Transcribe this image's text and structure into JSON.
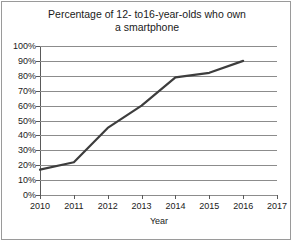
{
  "chart_data": {
    "type": "line",
    "title": "Percentage of 12- to16-year-olds who own a smartphone",
    "title_line1": "Percentage of 12- to16-year-olds who own",
    "title_line2": "a smartphone",
    "xlabel": "Year",
    "ylabel": "",
    "x": [
      2010,
      2011,
      2012,
      2013,
      2014,
      2015,
      2016
    ],
    "values": [
      17,
      22,
      45,
      60,
      79,
      82,
      90
    ],
    "series": [
      {
        "name": "Smartphone ownership",
        "values": [
          17,
          22,
          45,
          60,
          79,
          82,
          90
        ]
      }
    ],
    "xlim": [
      2010,
      2017
    ],
    "ylim": [
      0,
      100
    ],
    "xticks": [
      2010,
      2011,
      2012,
      2013,
      2014,
      2015,
      2016,
      2017
    ],
    "xtick_labels": [
      "2010",
      "2011",
      "2012",
      "2013",
      "2014",
      "2015",
      "2016",
      "2017"
    ],
    "yticks": [
      0,
      10,
      20,
      30,
      40,
      50,
      60,
      70,
      80,
      90,
      100
    ],
    "ytick_labels": [
      "0%",
      "10%",
      "20%",
      "30%",
      "40%",
      "50%",
      "60%",
      "70%",
      "80%",
      "90%",
      "100%"
    ],
    "grid": "horizontal",
    "legend": "none",
    "line_color": "#3d3d3d",
    "grid_color": "#8c8c8c",
    "axis_color": "#5a5a5a",
    "background_color": "#ffffff",
    "border_color": "#9a9a9a"
  }
}
